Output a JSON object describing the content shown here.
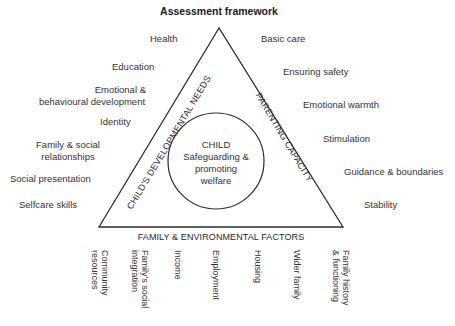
{
  "title": "Assessment framework",
  "center": {
    "line1": "CHILD",
    "line2": "Safeguarding &",
    "line3": "promoting",
    "line4": "welfare"
  },
  "sides": {
    "left": "CHILD'S DEVELOPMENTAL NEEDS",
    "right": "PARENTING CAPACITY",
    "bottom": "FAMILY & ENVIRONMENTAL FACTORS"
  },
  "developmental_needs": [
    {
      "line1": "Health"
    },
    {
      "line1": "Education"
    },
    {
      "line1": "Emotional &",
      "line2": "behavioural development"
    },
    {
      "line1": "Identity"
    },
    {
      "line1": "Family & social",
      "line2": "relationships"
    },
    {
      "line1": "Social presentation"
    },
    {
      "line1": "Selfcare skills"
    }
  ],
  "parenting_capacity": [
    {
      "line1": "Basic care"
    },
    {
      "line1": "Ensuring safety"
    },
    {
      "line1": "Emotional warmth"
    },
    {
      "line1": "Stimulation"
    },
    {
      "line1": "Guidance & boundaries"
    },
    {
      "line1": "Stability"
    }
  ],
  "family_environmental": [
    {
      "line1": "Community",
      "line2": "resources"
    },
    {
      "line1": "Family's social",
      "line2": "integration"
    },
    {
      "line1": "Income"
    },
    {
      "line1": "Employment"
    },
    {
      "line1": "Housing"
    },
    {
      "line1": "Wider family"
    },
    {
      "line1": "Family history",
      "line2": "& functioning"
    }
  ],
  "colors": {
    "line": "#2b2b2b",
    "text": "#333333",
    "background": "#ffffff"
  }
}
